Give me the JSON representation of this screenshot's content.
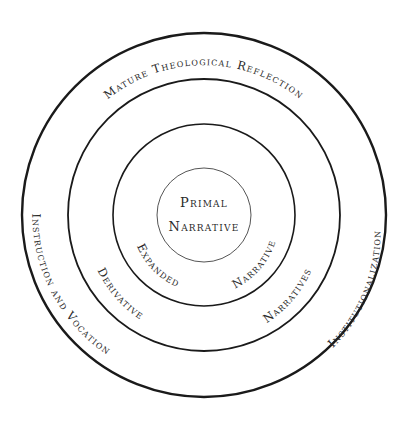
{
  "diagram": {
    "center": {
      "x": 204,
      "y": 215
    },
    "stroke_color": "#1a1a1a",
    "rings": [
      {
        "id": "primal",
        "radius": 47,
        "stroke_width": 1
      },
      {
        "id": "expanded",
        "radius": 91,
        "stroke_width": 1.6
      },
      {
        "id": "derivative",
        "radius": 136,
        "stroke_width": 1.8
      },
      {
        "id": "outer",
        "radius": 182,
        "stroke_width": 2.4
      }
    ],
    "labels": {
      "center_line1": "Primal",
      "center_line2": "Narrative",
      "expanded_left": "Expanded",
      "expanded_right": "Narrative",
      "derivative_left": "Derivative",
      "derivative_right": "Narratives",
      "outer_top": "Mature Theological Reflection",
      "outer_left": "Instruction and Vocation",
      "outer_right": "Institutionalization"
    }
  }
}
